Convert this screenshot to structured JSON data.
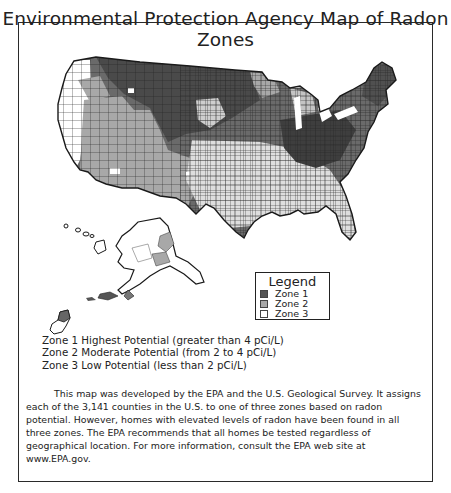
{
  "title": "Environmental Protection Agency Map of Radon Zones",
  "legend": {
    "title": "Legend",
    "items": [
      {
        "label": "Zone 1",
        "color": "#555555"
      },
      {
        "label": "Zone 2",
        "color": "#a8a8a8"
      },
      {
        "label": "Zone 3",
        "color": "#ffffff"
      }
    ]
  },
  "zone_descriptions": [
    "Zone 1 Highest Potential (greater than 4 pCi/L)",
    "Zone 2 Moderate Potential (from 2 to 4 pCi/L)",
    "Zone 3 Low Potential (less than 2 pCi/L)"
  ],
  "description": "This map was developed by the EPA and the U.S. Geological Survey. It assigns each of the 3,141 counties in the U.S. to one of three zones based on radon potential. However, homes with elevated levels of radon have been found in all three zones. The EPA recommends that all homes be tested regardless of geographical location. For more information, consult the EPA web site at www.EPA.gov.",
  "map": {
    "regions": [
      "Contiguous United States",
      "Alaska",
      "Hawaii",
      "Guam"
    ],
    "colors": {
      "zone1": "#555555",
      "zone2": "#a8a8a8",
      "zone3": "#ffffff",
      "border": "#222222"
    }
  }
}
